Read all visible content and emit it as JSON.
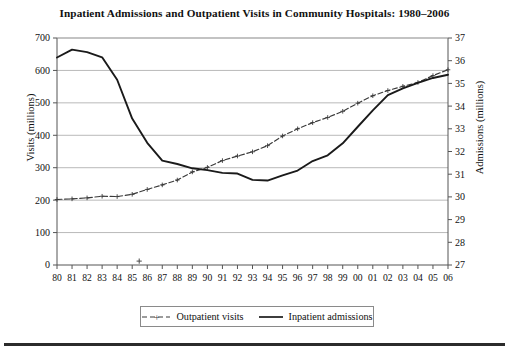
{
  "chart_data": {
    "type": "line",
    "title": "Inpatient Admissions and Outpatient Visits in Community Hospitals: 1980–2006",
    "xlabel": "",
    "ylabel": "Visits (millions)",
    "y2label": "Admissions (millions)",
    "grid": true,
    "legend_position": "bottom-center",
    "x": [
      "80",
      "81",
      "82",
      "83",
      "84",
      "85",
      "86",
      "87",
      "88",
      "89",
      "90",
      "91",
      "92",
      "93",
      "94",
      "95",
      "96",
      "97",
      "98",
      "99",
      "00",
      "01",
      "02",
      "03",
      "04",
      "05",
      "06"
    ],
    "x_full": [
      1980,
      1981,
      1982,
      1983,
      1984,
      1985,
      1986,
      1987,
      1988,
      1989,
      1990,
      1991,
      1992,
      1993,
      1994,
      1995,
      1996,
      1997,
      1998,
      1999,
      2000,
      2001,
      2002,
      2003,
      2004,
      2005,
      2006
    ],
    "ylim": [
      0,
      700
    ],
    "yticks": [
      0,
      100,
      200,
      300,
      400,
      500,
      600,
      700
    ],
    "y2lim": [
      27,
      37
    ],
    "y2ticks": [
      27,
      28,
      29,
      30,
      31,
      32,
      33,
      34,
      35,
      36,
      37
    ],
    "series": [
      {
        "name": "Outpatient visits",
        "axis": "left",
        "unit": "millions",
        "style": "dashed-with-plus-markers",
        "color": "#3a3a3a",
        "values": [
          202,
          204,
          207,
          212,
          211,
          218,
          233,
          247,
          262,
          287,
          301,
          322,
          336,
          349,
          368,
          398,
          420,
          439,
          455,
          474,
          499,
          522,
          538,
          551,
          563,
          584,
          602
        ]
      },
      {
        "name": "Inpatient admissions",
        "axis": "right",
        "unit": "millions",
        "style": "solid",
        "color": "#1a1a1a",
        "values": [
          36.14,
          36.49,
          36.38,
          36.15,
          35.16,
          33.45,
          32.38,
          31.6,
          31.45,
          31.26,
          31.18,
          31.06,
          31.03,
          30.75,
          30.72,
          30.95,
          31.16,
          31.58,
          31.83,
          32.36,
          33.09,
          33.81,
          34.48,
          34.78,
          35.02,
          35.24,
          35.38
        ]
      }
    ],
    "annotations": [
      {
        "type": "stray-marker",
        "glyph": "+",
        "x_year": "85",
        "y_value": 12
      }
    ]
  },
  "legend": {
    "items": [
      {
        "label": "Outpatient visits",
        "style": "dashed-plus"
      },
      {
        "label": "Inpatient admissions",
        "style": "solid"
      }
    ]
  }
}
